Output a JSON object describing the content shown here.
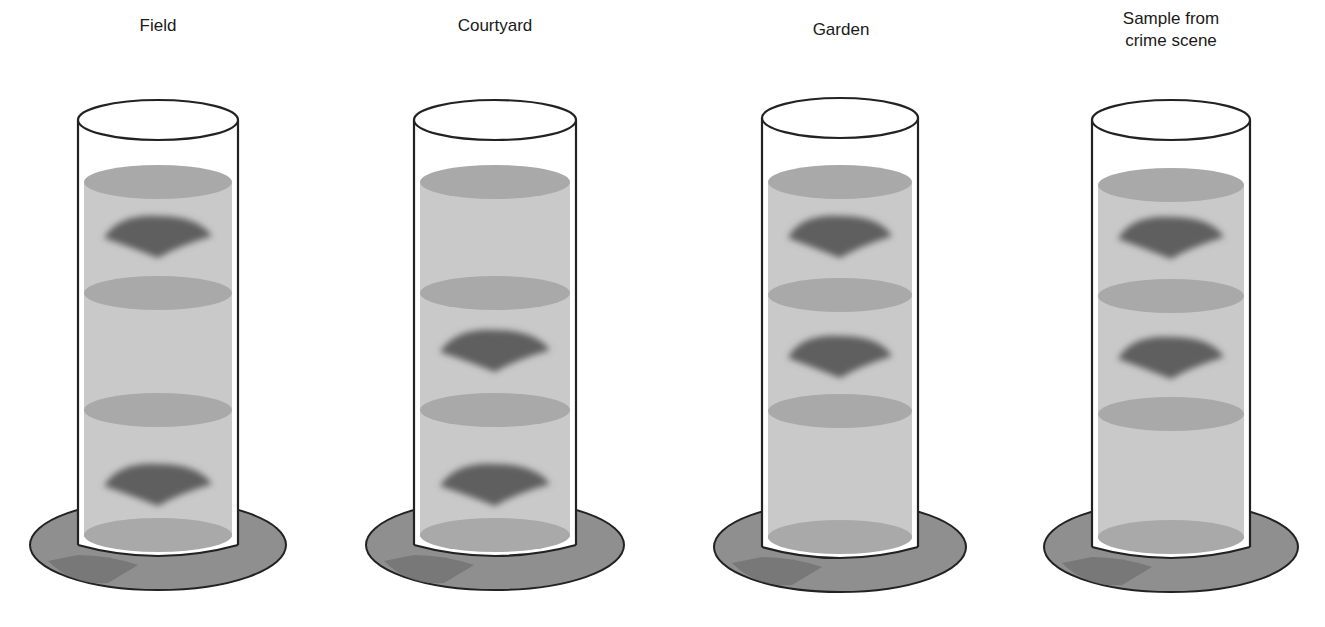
{
  "diagram": {
    "type": "density-gradient-column-comparison",
    "colors": {
      "liquid": "#c9c9c9",
      "light_band": "#a9a9a9",
      "dark_band": "#5e5e5e",
      "base": "#8f8f8f",
      "outline": "#222222"
    },
    "tubes": [
      {
        "label": "Field",
        "light_bands_y": [
          182,
          293,
          410,
          535
        ],
        "dark_bands_y": [
          236,
          484
        ]
      },
      {
        "label": "Courtyard",
        "light_bands_y": [
          182,
          293,
          410,
          535
        ],
        "dark_bands_y": [
          350,
          484
        ]
      },
      {
        "label": "Garden",
        "light_bands_y": [
          182,
          295,
          411,
          537
        ],
        "dark_bands_y": [
          236,
          356
        ]
      },
      {
        "label": "Sample from\ncrime scene",
        "label_line1": "Sample from",
        "label_line2": "crime scene",
        "light_bands_y": [
          185,
          296,
          414,
          537
        ],
        "dark_bands_y": [
          237,
          357
        ]
      }
    ]
  }
}
